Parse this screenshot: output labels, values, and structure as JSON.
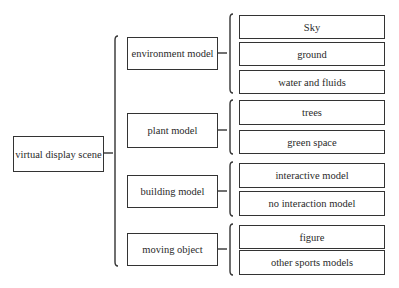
{
  "root": {
    "label": "virtual display scene"
  },
  "categories": [
    {
      "label": "environment model",
      "children": [
        "Sky",
        "ground",
        "water and fluids"
      ]
    },
    {
      "label": "plant model",
      "children": [
        "trees",
        "green space"
      ]
    },
    {
      "label": "building model",
      "children": [
        "interactive model",
        "no interaction model"
      ]
    },
    {
      "label": "moving object",
      "children": [
        "figure",
        "other sports models"
      ]
    }
  ]
}
